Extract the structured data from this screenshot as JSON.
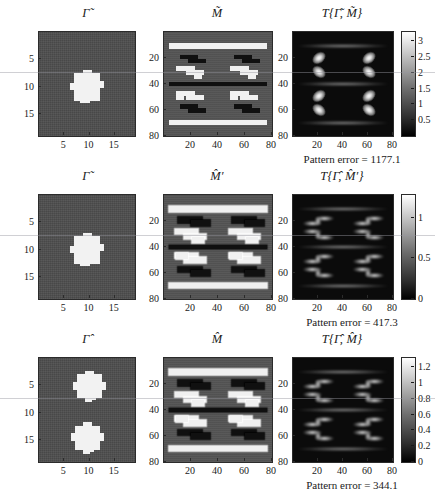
{
  "figure": {
    "width": 435,
    "height": 489,
    "background": "#ffffff"
  },
  "chart_data": {
    "type": "heatmap",
    "title": "",
    "rows": [
      {
        "row_index": 1,
        "panels": [
          {
            "id": "gamma-tilde",
            "title": "Γ̃",
            "title_base": "Γ",
            "title_accent": "tilde",
            "type": "binary-image",
            "xlabel": "",
            "ylabel": "",
            "xticks": [
              5,
              10,
              15
            ],
            "yticks": [
              5,
              10,
              15
            ],
            "xlim": [
              0,
              19
            ],
            "ylim": [
              0,
              19
            ],
            "background_value": 0,
            "foreground_value": 1,
            "shapes": [
              {
                "name": "center-square-blob",
                "x_center": 9.5,
                "y_center": 10.0,
                "width": 5.2,
                "height": 5.2
              }
            ],
            "colormap": "gray"
          },
          {
            "id": "m-tilde",
            "title": "M̃",
            "title_base": "M",
            "title_accent": "tilde",
            "type": "ternary-mask",
            "xticks": [
              20,
              40,
              60,
              80
            ],
            "yticks": [
              20,
              40,
              60,
              80
            ],
            "xlim": [
              0,
              80
            ],
            "ylim": [
              0,
              80
            ],
            "levels": {
              "dark": -1,
              "mid": 0,
              "bright": 1
            },
            "features": "horizontal bright bars at y~11 and y~70, dark bar at y~40, four staircase motifs",
            "colormap": "gray"
          },
          {
            "id": "t-gamma-tilde-m-tilde",
            "title": "T{Γ̃, M̃}",
            "type": "intensity-map",
            "xticks": [
              20,
              40,
              60,
              80
            ],
            "yticks": [
              20,
              40,
              60,
              80
            ],
            "xlim": [
              0,
              80
            ],
            "ylim": [
              0,
              80
            ],
            "colorbar": {
              "ticks": [
                0.5,
                1,
                1.5,
                2,
                2.5,
                3
              ],
              "tick_labels": [
                "0.5",
                "1",
                "1.5",
                "2",
                "2.5",
                "3"
              ],
              "min": 0,
              "max": 3.3,
              "colormap": "gray"
            },
            "caption": "Pattern error = 1177.1",
            "caption_label": "Pattern error",
            "caption_value": "1177.1",
            "peak_count": 8
          }
        ]
      },
      {
        "row_index": 2,
        "panels": [
          {
            "id": "gamma-tilde-2",
            "title": "Γ̃",
            "title_base": "Γ",
            "title_accent": "tilde",
            "type": "binary-image",
            "xticks": [
              5,
              10,
              15
            ],
            "yticks": [
              5,
              10,
              15
            ],
            "xlim": [
              0,
              19
            ],
            "ylim": [
              0,
              19
            ],
            "shapes": [
              {
                "name": "center-square-blob",
                "x_center": 9.5,
                "y_center": 10.0,
                "width": 5.2,
                "height": 5.2
              }
            ],
            "colormap": "gray"
          },
          {
            "id": "m-hat-prime",
            "title": "M̂′",
            "title_base": "M",
            "title_accent": "hat",
            "title_suffix": "′",
            "type": "ternary-mask",
            "xticks": [
              20,
              40,
              60,
              80
            ],
            "yticks": [
              20,
              40,
              60,
              80
            ],
            "xlim": [
              0,
              80
            ],
            "ylim": [
              0,
              80
            ],
            "features": "noisy reconstructed mask, ragged bright bars with speckle",
            "colormap": "gray"
          },
          {
            "id": "t-gamma-hat-m-hat-prime",
            "title": "T{Γ̂, M̂′}",
            "type": "intensity-map",
            "xticks": [
              20,
              40,
              60,
              80
            ],
            "yticks": [
              20,
              40,
              60,
              80
            ],
            "xlim": [
              0,
              80
            ],
            "ylim": [
              0,
              80
            ],
            "colorbar": {
              "ticks": [
                0,
                0.5,
                1
              ],
              "tick_labels": [
                "0",
                "0.5",
                "1"
              ],
              "min": 0,
              "max": 1.28,
              "colormap": "gray"
            },
            "caption": "Pattern error = 417.3",
            "caption_label": "Pattern error",
            "caption_value": "417.3",
            "peak_count": 8
          }
        ]
      },
      {
        "row_index": 3,
        "panels": [
          {
            "id": "gamma-hat",
            "title": "Γ̂",
            "title_base": "Γ",
            "title_accent": "hat",
            "type": "binary-image",
            "xticks": [
              5,
              10,
              15
            ],
            "yticks": [
              5,
              10,
              15
            ],
            "xlim": [
              0,
              19
            ],
            "ylim": [
              0,
              19
            ],
            "shapes": [
              {
                "name": "upper-cross-blob",
                "x_center": 10.0,
                "y_center": 5.2,
                "width": 4.8,
                "height": 4.4
              },
              {
                "name": "lower-cross-blob",
                "x_center": 9.6,
                "y_center": 14.6,
                "width": 4.8,
                "height": 4.4
              }
            ],
            "colormap": "gray"
          },
          {
            "id": "m-hat",
            "title": "M̂",
            "title_base": "M",
            "title_accent": "hat",
            "type": "ternary-mask",
            "xticks": [
              20,
              40,
              60,
              80
            ],
            "yticks": [
              20,
              40,
              60,
              80
            ],
            "xlim": [
              0,
              80
            ],
            "ylim": [
              0,
              80
            ],
            "features": "noisy mask with bright bars and dark staircase motifs",
            "colormap": "gray"
          },
          {
            "id": "t-gamma-hat-m-hat",
            "title": "T{Γ̂, M̂}",
            "type": "intensity-map",
            "xticks": [
              20,
              40,
              60,
              80
            ],
            "yticks": [
              20,
              40,
              60,
              80
            ],
            "xlim": [
              0,
              80
            ],
            "ylim": [
              0,
              80
            ],
            "colorbar": {
              "ticks": [
                0,
                0.2,
                0.4,
                0.6,
                0.8,
                1,
                1.2
              ],
              "tick_labels": [
                "0",
                "0.2",
                "0.4",
                "0.6",
                "0.8",
                "1",
                "1.2"
              ],
              "min": 0,
              "max": 1.32,
              "colormap": "gray"
            },
            "caption": "Pattern error = 344.1",
            "caption_label": "Pattern error",
            "caption_value": "344.1",
            "peak_count": 8
          }
        ]
      }
    ]
  },
  "colors": {
    "background": "#ffffff",
    "axis_line": "#2b2b2b",
    "gamma_background": "#4d4d4d",
    "gamma_foreground": "#f2f2f2",
    "mask_background": "#545454",
    "mask_bright": "#f0f0f0",
    "mask_dark": "#101010",
    "t_background": "#0b0b0b",
    "text": "#1a1a1a"
  }
}
